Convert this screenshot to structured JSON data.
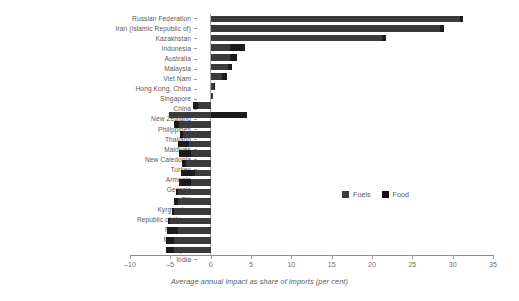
{
  "chart_data": {
    "type": "bar",
    "orientation": "horizontal",
    "stacked": true,
    "title": "",
    "subtitle": "",
    "xlabel": "Average annual impact as share of imports (per cent)",
    "ylabel": "",
    "xlim": [
      -10,
      35
    ],
    "xticks": [
      -10,
      -5,
      0,
      5,
      10,
      15,
      20,
      25,
      30,
      35
    ],
    "xticklabels": [
      "–10",
      "–5",
      "0",
      "5",
      "10",
      "15",
      "20",
      "25",
      "30",
      "35"
    ],
    "grid": false,
    "legend_position": "inside-right",
    "legend": [
      {
        "name": "Fuels",
        "color": "#3b3b3b"
      },
      {
        "name": "Food",
        "color": "#111111"
      }
    ],
    "categories": [
      "Russian Federation",
      "Iran (Islamic Republic of)",
      "Kazakhstan",
      "Indonesia",
      "Australia",
      "Malaysia",
      "Viet Nam",
      "Hong Kong, China",
      "Singapore",
      "China",
      "New Zealand",
      "Philippines",
      "Thailand",
      "Maldives",
      "New Caledonia",
      "Turkey",
      "Armenia",
      "Georgia",
      "Fiji",
      "Kyrgyzstan",
      "Republic of Korea",
      "Pakistan",
      "Mongolia",
      "Japan",
      "India"
    ],
    "series": [
      {
        "name": "Fuels",
        "color": "#3b3b3b",
        "values": [
          30.9,
          28.4,
          21.3,
          2.4,
          2.4,
          2.1,
          1.4,
          0.4,
          0.3,
          -1.6,
          -5.2,
          -3.9,
          -3.4,
          -2.7,
          -2.4,
          -3.0,
          -2.0,
          -2.4,
          -4.0,
          -4.0,
          -4.6,
          -5.0,
          -4.1,
          -4.6,
          -4.5
        ]
      },
      {
        "name": "Food",
        "color": "#111111",
        "values": [
          0.4,
          0.5,
          0.4,
          1.8,
          0.9,
          0.6,
          0.6,
          0.1,
          0.0,
          -0.6,
          4.5,
          -0.6,
          -0.4,
          -1.4,
          -1.5,
          -0.6,
          -1.7,
          -1.5,
          -0.3,
          -0.5,
          -0.2,
          -0.3,
          -1.3,
          -0.9,
          -1.0
        ]
      }
    ],
    "totals": [
      31.3,
      28.9,
      21.7,
      4.2,
      3.3,
      2.7,
      2.0,
      0.5,
      0.3,
      -2.2,
      -0.7,
      -4.5,
      -3.8,
      -4.1,
      -3.9,
      -3.6,
      -3.7,
      -3.9,
      -4.3,
      -4.5,
      -4.8,
      -5.3,
      -5.4,
      -5.5,
      -5.5
    ]
  }
}
